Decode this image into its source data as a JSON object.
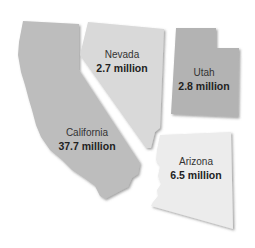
{
  "title": "",
  "states": [
    {
      "id": "california",
      "name": "California",
      "population": "37.7 million",
      "fill": "#bdbdbd"
    },
    {
      "id": "nevada",
      "name": "Nevada",
      "population": "2.7 million",
      "fill": "#d9d9d9"
    },
    {
      "id": "utah",
      "name": "Utah",
      "population": "2.8 million",
      "fill": "#b3b3b3"
    },
    {
      "id": "arizona",
      "name": "Arizona",
      "population": "6.5 million",
      "fill": "#ececec"
    }
  ]
}
